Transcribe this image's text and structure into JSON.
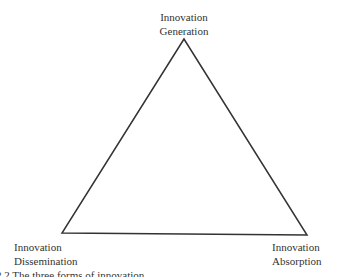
{
  "diagram": {
    "type": "triangle",
    "nodes": [
      {
        "id": "top",
        "line1": "Innovation",
        "line2": "Generation"
      },
      {
        "id": "bottom_left",
        "line1": "Innovation",
        "line2": "Dissemination"
      },
      {
        "id": "bottom_right",
        "line1": "Innovation",
        "line2": "Absorption"
      }
    ],
    "edges": [
      [
        "top",
        "bottom_left"
      ],
      [
        "bottom_left",
        "bottom_right"
      ],
      [
        "bottom_right",
        "top"
      ]
    ],
    "line_color": "#333333"
  },
  "caption": "2.2 The three forms of innovation"
}
